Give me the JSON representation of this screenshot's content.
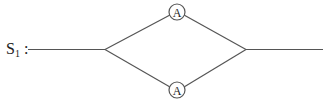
{
  "diagram": {
    "system_label": {
      "main": "S",
      "subscript": "1",
      "suffix": " :"
    },
    "type": "parallel-system",
    "components": [
      {
        "id": "top",
        "label": "A"
      },
      {
        "id": "bottom",
        "label": "A"
      }
    ],
    "colors": {
      "line": "#555555",
      "text": "#222222",
      "background": "#ffffff"
    }
  }
}
